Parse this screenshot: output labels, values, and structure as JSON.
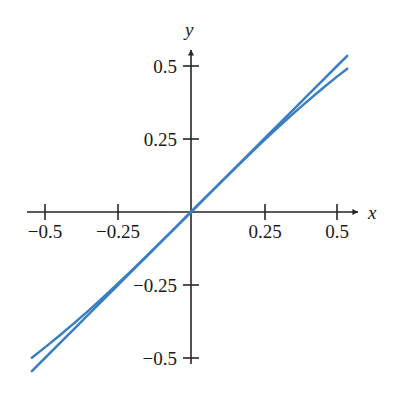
{
  "chart_data": {
    "type": "line",
    "title": "",
    "subtitle": "",
    "xlabel": "x",
    "ylabel": "y",
    "xlim": [
      -0.56,
      0.58
    ],
    "ylim": [
      -0.56,
      0.58
    ],
    "grid": false,
    "legend": null,
    "axis_style": "cartesian-cross-arrows",
    "accent_color": "#3a7fc1",
    "axis_color": "#262626",
    "text_color": "#1a1a1a",
    "background": "#ffffff",
    "xticks": [
      -0.5,
      -0.25,
      0.25,
      0.5
    ],
    "xtick_labels": [
      "−0.5",
      "−0.25",
      "0.25",
      "0.5"
    ],
    "yticks": [
      0.5,
      0.25,
      -0.25,
      -0.5
    ],
    "ytick_labels": [
      "0.5",
      "0.25",
      "−0.25",
      "−0.5"
    ],
    "series": [
      {
        "name": "y = x",
        "color": "#3a7fc1",
        "x": [
          -0.545,
          -0.5,
          -0.45,
          -0.4,
          -0.35,
          -0.3,
          -0.25,
          -0.2,
          -0.15,
          -0.1,
          -0.05,
          0.0,
          0.05,
          0.1,
          0.15,
          0.2,
          0.25,
          0.3,
          0.35,
          0.4,
          0.45,
          0.5,
          0.535
        ],
        "values": [
          -0.545,
          -0.5,
          -0.45,
          -0.4,
          -0.35,
          -0.3,
          -0.25,
          -0.2,
          -0.15,
          -0.1,
          -0.05,
          0.0,
          0.05,
          0.1,
          0.15,
          0.2,
          0.25,
          0.3,
          0.35,
          0.4,
          0.45,
          0.5,
          0.535
        ]
      },
      {
        "name": "y = arctan x",
        "color": "#3a7fc1",
        "x": [
          -0.545,
          -0.5,
          -0.45,
          -0.4,
          -0.35,
          -0.3,
          -0.25,
          -0.2,
          -0.15,
          -0.1,
          -0.05,
          0.0,
          0.05,
          0.1,
          0.15,
          0.2,
          0.25,
          0.3,
          0.35,
          0.4,
          0.45,
          0.5,
          0.535
        ],
        "values": [
          -0.4993,
          -0.4636,
          -0.4229,
          -0.3805,
          -0.3367,
          -0.2915,
          -0.245,
          -0.1974,
          -0.1489,
          -0.0997,
          -0.05,
          0.0,
          0.05,
          0.0997,
          0.1489,
          0.1974,
          0.245,
          0.2915,
          0.3367,
          0.3805,
          0.4229,
          0.4636,
          0.4909
        ]
      }
    ]
  },
  "axes": {
    "x_axis_label": "x",
    "y_axis_label": "y"
  }
}
